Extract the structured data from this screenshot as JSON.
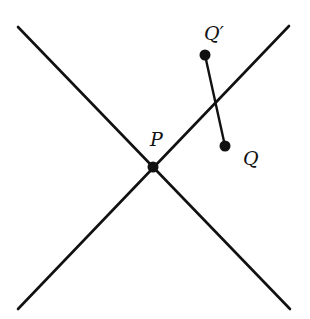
{
  "diagram": {
    "colors": {
      "stroke": "#111111",
      "background": "#ffffff"
    },
    "lines": [
      {
        "name": "line-descending",
        "x1": 18,
        "y1": 27,
        "x2": 290,
        "y2": 309
      },
      {
        "name": "line-ascending",
        "x1": 18,
        "y1": 309,
        "x2": 289,
        "y2": 26
      }
    ],
    "segment": {
      "name": "segment-Q-Qprime",
      "x1": 205,
      "y1": 55,
      "x2": 225,
      "y2": 146
    },
    "points": [
      {
        "name": "P",
        "x": 153,
        "y": 167
      },
      {
        "name": "Q'",
        "x": 205,
        "y": 55
      },
      {
        "name": "Q",
        "x": 225,
        "y": 146
      }
    ],
    "labels": {
      "P": "P",
      "Qprime": "Q′",
      "Q": "Q"
    }
  }
}
